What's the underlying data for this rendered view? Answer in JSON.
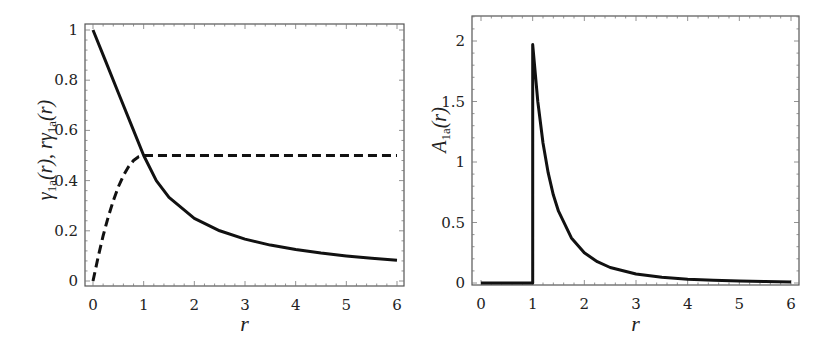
{
  "chart_data": [
    {
      "type": "line",
      "xlabel": "r",
      "ylabel": "γ_1a(r), rγ_1a(r)",
      "ylabel_parts": [
        "γ",
        "1a",
        "(r), ",
        "rγ",
        "1a",
        "(r)"
      ],
      "xlim": [
        0,
        6
      ],
      "ylim": [
        0,
        1
      ],
      "xticks": [
        "0",
        "1",
        "2",
        "3",
        "4",
        "5",
        "6"
      ],
      "yticks": [
        "0",
        "0.2",
        "0.4",
        "0.6",
        "0.8",
        "1"
      ],
      "ytick_values": [
        0,
        0.2,
        0.4,
        0.6,
        0.8,
        1
      ],
      "grid": false,
      "series": [
        {
          "name": "γ_1a(r)",
          "style": "solid",
          "x": [
            0,
            0.25,
            0.5,
            0.75,
            1,
            1.25,
            1.5,
            2,
            2.5,
            3,
            3.5,
            4,
            4.5,
            5,
            5.5,
            6
          ],
          "y": [
            1,
            0.875,
            0.75,
            0.625,
            0.5,
            0.4,
            0.333,
            0.25,
            0.2,
            0.167,
            0.143,
            0.125,
            0.111,
            0.1,
            0.091,
            0.083
          ]
        },
        {
          "name": "rγ_1a(r)",
          "style": "dashed",
          "x": [
            0,
            0.1,
            0.2,
            0.3,
            0.4,
            0.5,
            0.6,
            0.7,
            0.8,
            0.9,
            1,
            2,
            3,
            4,
            5,
            6
          ],
          "y": [
            0,
            0.095,
            0.18,
            0.255,
            0.32,
            0.375,
            0.42,
            0.455,
            0.48,
            0.495,
            0.5,
            0.5,
            0.5,
            0.5,
            0.5,
            0.5
          ]
        }
      ]
    },
    {
      "type": "line",
      "xlabel": "r",
      "ylabel": "A_1a(r)",
      "ylabel_parts": [
        "A",
        "1a",
        "(r)"
      ],
      "xlim": [
        0,
        6
      ],
      "ylim": [
        0,
        2.2
      ],
      "xticks": [
        "0",
        "1",
        "2",
        "3",
        "4",
        "5",
        "6"
      ],
      "yticks": [
        "0",
        "0.5",
        "1",
        "1.5",
        "2"
      ],
      "ytick_values": [
        0,
        0.5,
        1,
        1.5,
        2
      ],
      "grid": false,
      "series": [
        {
          "name": "A_1a(r)",
          "style": "solid",
          "x": [
            0,
            1,
            1,
            1.1,
            1.2,
            1.3,
            1.4,
            1.5,
            1.75,
            2,
            2.25,
            2.5,
            3,
            3.5,
            4,
            4.5,
            5,
            5.5,
            6
          ],
          "y": [
            0,
            0,
            1.97,
            1.5,
            1.157,
            0.91,
            0.729,
            0.593,
            0.373,
            0.25,
            0.176,
            0.128,
            0.074,
            0.047,
            0.031,
            0.022,
            0.016,
            0.012,
            0.0093
          ]
        }
      ]
    }
  ]
}
